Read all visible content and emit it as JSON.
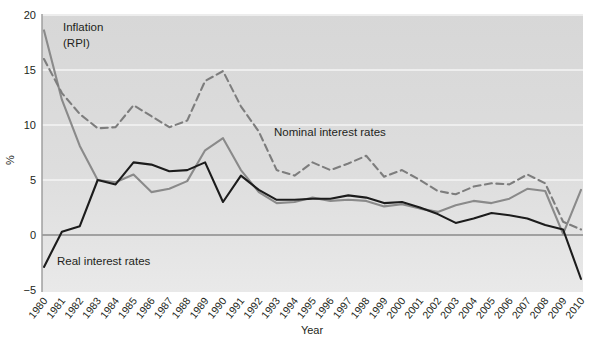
{
  "chart_data": {
    "type": "line",
    "title": "",
    "xlabel": "Year",
    "ylabel": "%",
    "ylim": [
      -5,
      20
    ],
    "yticks": [
      -5,
      0,
      5,
      10,
      15,
      20
    ],
    "ytick_labels": [
      "−5",
      "0",
      "5",
      "10",
      "15",
      "20"
    ],
    "grid": true,
    "grid_axis": "y",
    "legend": "inline-annotations",
    "x": [
      1980,
      1981,
      1982,
      1983,
      1984,
      1985,
      1986,
      1987,
      1988,
      1989,
      1990,
      1991,
      1992,
      1993,
      1994,
      1995,
      1996,
      1997,
      1998,
      1999,
      2000,
      2001,
      2002,
      2003,
      2004,
      2005,
      2006,
      2007,
      2008,
      2009,
      2010
    ],
    "categories": [
      "1980",
      "1981",
      "1982",
      "1983",
      "1984",
      "1985",
      "1986",
      "1987",
      "1988",
      "1989",
      "1990",
      "1991",
      "1992",
      "1993",
      "1994",
      "1995",
      "1996",
      "1997",
      "1998",
      "1999",
      "2000",
      "2001",
      "2002",
      "2003",
      "2004",
      "2005",
      "2006",
      "2007",
      "2008",
      "2009",
      "2010"
    ],
    "series": [
      {
        "name": "Inflation (RPI)",
        "key": "inflation",
        "color": "#8a8a8a",
        "style": "solid",
        "width": 2.1,
        "values": [
          18.6,
          12.3,
          8.1,
          5.0,
          4.8,
          5.5,
          3.9,
          4.2,
          4.9,
          7.7,
          8.8,
          5.9,
          3.9,
          2.9,
          3.0,
          3.4,
          3.1,
          3.2,
          3.1,
          2.6,
          2.8,
          2.4,
          2.1,
          2.7,
          3.1,
          2.9,
          3.3,
          4.2,
          4.0,
          0.1,
          4.1
        ]
      },
      {
        "name": "Nominal interest rates",
        "key": "nominal",
        "color": "#7d7d7d",
        "style": "dashed",
        "width": 2.1,
        "values": [
          16.0,
          12.9,
          11.0,
          9.7,
          9.8,
          11.8,
          10.8,
          9.8,
          10.4,
          14.0,
          14.9,
          11.7,
          9.4,
          5.9,
          5.4,
          6.6,
          5.9,
          6.5,
          7.2,
          5.3,
          5.9,
          5.0,
          4.0,
          3.7,
          4.4,
          4.7,
          4.6,
          5.5,
          4.7,
          1.2,
          0.5
        ]
      },
      {
        "name": "Real interest rates",
        "key": "real",
        "color": "#1c1c1c",
        "style": "solid",
        "width": 2.1,
        "values": [
          -2.9,
          0.3,
          0.8,
          5.0,
          4.6,
          6.6,
          6.4,
          5.8,
          5.9,
          6.6,
          3.0,
          5.4,
          4.1,
          3.2,
          3.2,
          3.3,
          3.3,
          3.6,
          3.4,
          2.9,
          3.0,
          2.5,
          1.9,
          1.1,
          1.5,
          2.0,
          1.8,
          1.5,
          0.9,
          0.5,
          -4.0
        ]
      }
    ],
    "annotations": [
      {
        "name": "inflation-label",
        "text": "Inflation",
        "text2": "(RPI)",
        "x": 1980.8,
        "y": 18.0
      },
      {
        "name": "nominal-label",
        "text": "Nominal interest rates",
        "x": 1992.2,
        "y": 10.2
      },
      {
        "name": "real-label",
        "text": "Real interest rates",
        "x": 1980.7,
        "y": -2.2
      }
    ],
    "colors": {
      "plot_background": "#dcdcdc",
      "gridline": "#f2f2f2",
      "axis": "#6f6f6f",
      "text": "#231f20",
      "page_background": "#ffffff"
    }
  }
}
